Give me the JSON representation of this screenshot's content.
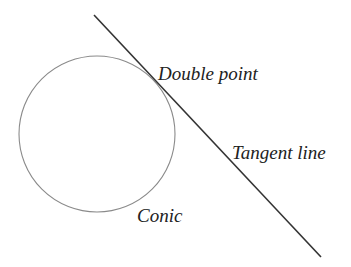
{
  "diagram": {
    "labels": {
      "double_point": "Double point",
      "tangent_line": "Tangent line",
      "conic": "Conic"
    },
    "colors": {
      "conic_stroke": "#888888",
      "line_stroke": "#333333",
      "text": "#222222"
    }
  }
}
